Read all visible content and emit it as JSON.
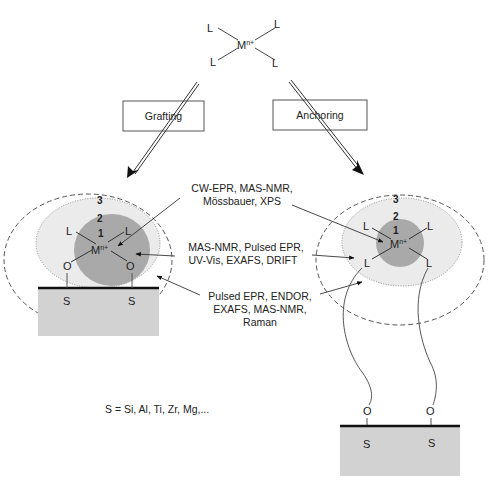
{
  "precursor": {
    "metal": "M",
    "charge": "n+",
    "ligands": [
      "L",
      "L",
      "L",
      "L"
    ]
  },
  "routes": {
    "left": "Grafting",
    "right": "Anchoring"
  },
  "techniques": {
    "zone1": [
      "CW-EPR, MAS-NMR,",
      "Mössbauer, XPS"
    ],
    "zone2": [
      "MAS-NMR, Pulsed EPR,",
      "UV-Vis, EXAFS, DRIFT"
    ],
    "zone3": [
      "Pulsed EPR, ENDOR,",
      "EXAFS, MAS-NMR,",
      "Raman"
    ]
  },
  "grafted": {
    "zones": [
      "1",
      "2",
      "3"
    ],
    "metal": "M",
    "charge": "n+",
    "ligands": [
      "L",
      "L"
    ],
    "oxygens": [
      "O",
      "O"
    ],
    "support_atoms": [
      "S",
      "S"
    ]
  },
  "anchored": {
    "zones": [
      "1",
      "2",
      "3"
    ],
    "metal": "M",
    "charge": "n+",
    "ligands": [
      "L",
      "L",
      "L",
      "L"
    ],
    "oxygens": [
      "O",
      "O"
    ],
    "support_atoms": [
      "S",
      "S"
    ]
  },
  "legend": "S = Si, Al, Ti, Zr, Mg,...",
  "colors": {
    "zone1": "#a9a9a9",
    "zone2": "#ebebeb",
    "support": "#d2d2d2",
    "line": "#333333"
  }
}
